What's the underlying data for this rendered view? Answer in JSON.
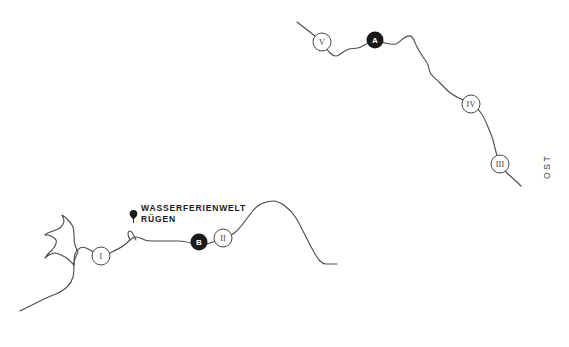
{
  "map": {
    "background_color": "#ffffff",
    "line_color": "#4a4a4a",
    "marker_fill_color": "#1a1a1a",
    "marker_text_color": "#ffffff",
    "place_label": {
      "line1": "WASSERFERIENWELT",
      "line2": "RÜGEN",
      "pin_icon": "map-pin-icon"
    },
    "direction_label": "OST",
    "markers": [
      {
        "id": "marker-v",
        "label": "V",
        "style": "outline",
        "cx": 322,
        "cy": 42,
        "r": 9
      },
      {
        "id": "marker-a",
        "label": "A",
        "style": "filled",
        "cx": 375,
        "cy": 40,
        "r": 8.5
      },
      {
        "id": "marker-iv",
        "label": "IV",
        "style": "outline",
        "cx": 471,
        "cy": 104,
        "r": 9
      },
      {
        "id": "marker-iii",
        "label": "III",
        "style": "outline",
        "cx": 500,
        "cy": 164,
        "r": 9
      },
      {
        "id": "marker-i",
        "label": "I",
        "style": "outline",
        "cx": 101,
        "cy": 256,
        "r": 9
      },
      {
        "id": "marker-b",
        "label": "B",
        "style": "filled",
        "cx": 199,
        "cy": 242,
        "r": 8.5
      },
      {
        "id": "marker-ii",
        "label": "II",
        "style": "outline",
        "cx": 223,
        "cy": 238,
        "r": 9
      }
    ],
    "paths": {
      "northeast_coast": "M 297 22 L 315 36 C 318 38 320 40 322 42 C 325 46 327 50 330 53 C 333 56 336 57 339 55 C 342 53 345 50 349 49 C 353 48 357 49 361 47 C 365 45 369 42 373 41 C 377 40 381 42 385 43 C 389 44 392 45 396 44 C 399 43 401 40 404 38 C 407 36 410 35 412 37 C 414 39 415 43 417 47 C 419 51 421 54 423 57 C 425 60 427 62 428 65 C 429 68 429 71 431 74 C 433 77 436 79 439 82 C 442 85 445 88 448 91 C 451 94 455 96 459 98 C 463 100 467 102 471 104 C 475 106 478 109 481 113 C 484 117 486 122 488 127 C 490 132 492 136 493 140 C 494 144 495 148 496 152 C 497 156 498 160 500 164 C 502 168 505 171 508 174 C 511 177 515 180 518 183 L 521 186",
      "southern_coast": "M 20 311 C 26 308 32 305 38 302 C 44 299 50 296 56 294 C 60 292 64 290 67 287 C 70 284 72 281 73 277 C 74 273 74 269 74 265 C 74 261 74 257 75 254 C 76 251 78 249 80 248 C 82 247 84 247 86 248 C 89 249 92 251 95 253 C 98 255 99 256 101 256 C 104 256 108 254 112 252 C 116 250 120 248 123 246 C 126 244 128 242 130 240 C 132 238 134 237 136 237 C 139 237 142 239 145 240 C 148 241 151 241 155 241 C 159 241 163 241 167 241 C 171 241 175 241 179 241 C 183 241 187 242 191 243 C 195 244 198 245 201 245 C 204 245 207 244 210 243 C 213 242 216 241 219 240 C 221 239 222 238 223 238 C 226 237 230 236 233 234 C 236 232 239 229 242 225 C 245 221 248 217 251 213 C 254 209 257 206 261 204 C 265 202 269 201 273 201 C 277 201 281 203 285 206 C 289 209 293 213 296 218 C 299 223 302 229 305 235 C 308 241 311 247 314 252 C 316 256 318 259 320 261 C 322 263 324 264 326 264 C 329 264 333 264 337 264",
      "island_detail": "M 74 265 C 72 263 70 261 68 259 C 66 257 63 256 61 255 C 59 254 57 253 55 253 C 53 253 51 254 49 255 C 47 256 46 257 45 258 C 46 256 48 254 50 252 C 52 250 54 248 55 246 C 56 244 57 242 56 240 C 55 238 53 237 51 236 C 49 235 47 235 45 235 C 47 233 50 232 53 231 C 56 230 59 229 61 227 C 63 225 64 223 64 221 C 64 219 63 217 62 215 C 64 216 66 218 68 220 C 70 222 72 224 73 227 C 74 230 74 233 74 236 C 74 239 74 242 75 245 C 76 248 77 250 78 252 C 77 254 76 256 75 259 C 74 261 74 263 74 265 Z",
      "inlet_detail": "M 130 240 C 129 238 128 236 128 234 C 128 232 129 231 130 231 C 131 231 132 232 133 234 C 134 236 135 238 136 240"
    }
  }
}
